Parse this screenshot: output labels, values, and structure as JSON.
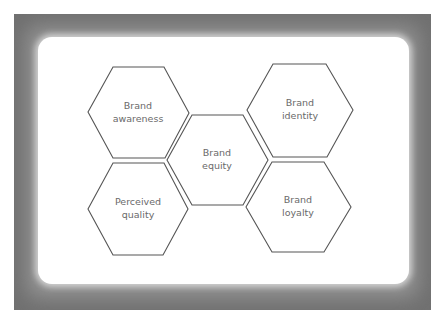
{
  "diagram": {
    "title": "",
    "nodes": [
      {
        "id": "awareness",
        "line1": "Brand",
        "line2": "awareness"
      },
      {
        "id": "identity",
        "line1": "Brand",
        "line2": "identity"
      },
      {
        "id": "equity",
        "line1": "Brand",
        "line2": "equity"
      },
      {
        "id": "quality",
        "line1": "Perceived",
        "line2": "quality"
      },
      {
        "id": "loyalty",
        "line1": "Brand",
        "line2": "loyalty"
      }
    ],
    "colors": {
      "frame": "#9a9a9a",
      "card": "#ffffff",
      "stroke": "#555555",
      "text": "#6a6a6a"
    }
  }
}
